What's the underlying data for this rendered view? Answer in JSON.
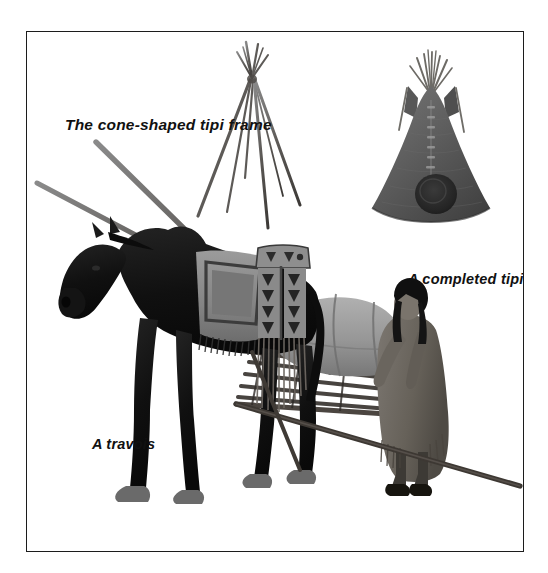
{
  "plate": {
    "background_color": "#ffffff",
    "border_color": "#1c1c1c",
    "title_hidden": "",
    "labels": {
      "frame": "The cone-shaped tipi frame",
      "completed_tipi": "A completed tipi",
      "travois": "A travois"
    }
  },
  "figures": [
    {
      "name": "tipi-pole-frame",
      "caption": "The cone-shaped tipi frame",
      "description": "Bare cone of lashed lodge poles",
      "pole_count": 5,
      "color": "#6b6b6b"
    },
    {
      "name": "completed-tipi",
      "caption": "A completed tipi",
      "description": "Hide-covered cone with smoke flaps, lacing pins and round door",
      "cover_color": "#5e5e5e",
      "door_color": "#2a2a2a"
    },
    {
      "name": "horse-with-travois",
      "caption": "A travois",
      "description": "Dark horse harnessed to a two-pole travois carrying a bundled load, with a woman tending the load",
      "horse_color": "#151515",
      "hoof_color": "#6a6a6a",
      "pole_color": "#4a4340",
      "blanket_color": "#8d8d8d",
      "beadwork_color": "#2f2f2f",
      "woman_dress_color": "#6f6a66",
      "woman_hair_color": "#121212",
      "load_color": "#9a9a9a"
    }
  ]
}
